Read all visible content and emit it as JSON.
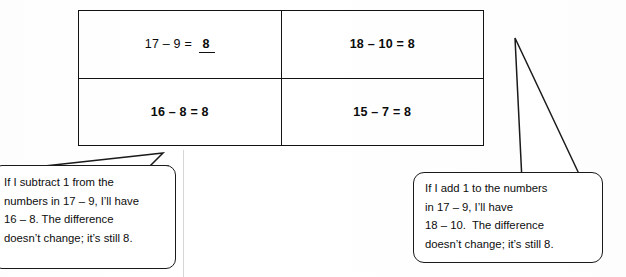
{
  "document": {
    "type": "math-worksheet-constant-difference"
  },
  "table": {
    "rows": [
      {
        "cells": [
          {
            "id": "cell-r1c1",
            "prompt": "17 – 9 = ",
            "answer": "8",
            "answer_filled": true,
            "bold": false
          },
          {
            "id": "cell-r1c2",
            "equation": "18 – 10 = 8",
            "bold": true
          }
        ]
      },
      {
        "cells": [
          {
            "id": "cell-r2c1",
            "equation": "16 – 8 = 8",
            "bold": true
          },
          {
            "id": "cell-r2c2",
            "equation": "15 – 7 = 8",
            "bold": true
          }
        ]
      }
    ]
  },
  "callouts": {
    "left": {
      "lines": [
        "If I subtract 1 from the",
        "numbers in 17 – 9, I’ll have",
        "16 – 8. The difference",
        "doesn’t change; it’s still 8."
      ],
      "points_to": "cell-r2c1"
    },
    "right": {
      "lines": [
        "If I add 1 to the numbers",
        "in 17 – 9, I’ll have",
        "18 – 10.  The difference",
        "doesn’t change; it’s still 8."
      ],
      "points_to": "cell-r1c2"
    }
  },
  "colors": {
    "ink": "#0d0d0d",
    "rule": "#121212",
    "paper": "#ffffff"
  }
}
